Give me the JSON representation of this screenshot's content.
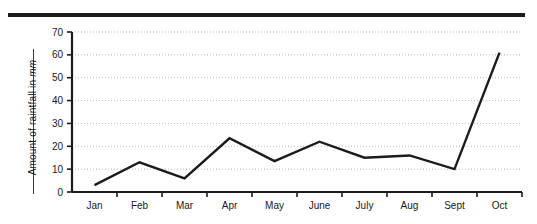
{
  "figure": {
    "top_rule_name": "top-horizontal-rule"
  },
  "chart_data": {
    "type": "line",
    "title": "",
    "xlabel": "",
    "ylabel": "Amount of raintfall in mm",
    "ylabel_text": "Amount of raintfall in ",
    "ylabel_unit": "mm",
    "categories": [
      "Jan",
      "Feb",
      "Mar",
      "Apr",
      "May",
      "June",
      "July",
      "Aug",
      "Sept",
      "Oct"
    ],
    "values": [
      3,
      13,
      6,
      23.5,
      13.5,
      22,
      15,
      16,
      10,
      61
    ],
    "series": [
      {
        "name": "Rainfall",
        "values": [
          3,
          13,
          6,
          23.5,
          13.5,
          22,
          15,
          16,
          10,
          61
        ]
      }
    ],
    "ylim": [
      0,
      70
    ],
    "yticks": [
      0,
      10,
      20,
      30,
      40,
      50,
      60,
      70
    ],
    "ytick_labels": [
      "0",
      "10",
      "20",
      "30",
      "40",
      "50",
      "60",
      "70"
    ],
    "grid": true,
    "grid_style": "dotted-horizontal",
    "legend": "none",
    "line_color": "#1b1b1b",
    "axis_color": "#1b1b1b",
    "grid_color": "#b9b9b9",
    "background": "#ffffff"
  }
}
